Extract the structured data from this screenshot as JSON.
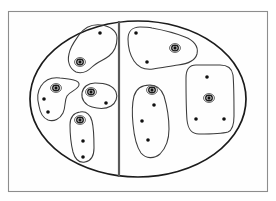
{
  "figure": {
    "title": "",
    "caption": ""
  },
  "colors": {
    "background": "#ffffff",
    "frame_stroke": "#8d8d8d",
    "universe_stroke": "#1b1b1b",
    "divider_stroke": "#5a5a5a",
    "region_stroke": "#3b3b3b",
    "point_fill": "#101010",
    "ring_stroke": "#1b1b1b"
  },
  "frame": {
    "name": "outer-frame",
    "x": 8,
    "y": 11,
    "width": 260,
    "height": 181
  },
  "universe": {
    "name": "universe-ellipse",
    "cx": 138,
    "cy": 99,
    "rx": 108,
    "ry": 78
  },
  "divider": {
    "name": "vertical-divider",
    "x1": 119,
    "y1": 21,
    "x2": 119,
    "y2": 177
  },
  "regions": [
    {
      "id": "region-left-top",
      "side": "left",
      "path": "M 101 25 C 92 24 84 28 79 35 C 74 42 70 47 69 54 C 67 62 70 69 76 72 C 82 74 88 71 92 67 C 97 62 104 60 109 56 C 114 52 117 45 117 38 C 117 31 110 26 101 25 Z"
    },
    {
      "id": "region-left-middle",
      "side": "left",
      "path": "M 60 78 C 52 77 45 80 41 86 C 37 92 37 99 39 106 C 40 112 43 118 48 120 C 54 122 60 119 63 113 C 66 107 64 101 67 96 C 70 91 78 90 79 85 C 80 80 70 79 60 78 Z"
    },
    {
      "id": "region-left-center",
      "side": "left",
      "path": "M 95 83 C 88 83 83 87 82 93 C 81 99 85 105 92 107 C 99 109 106 109 111 106 C 116 103 118 97 116 92 C 114 87 107 83 95 83 Z"
    },
    {
      "id": "region-left-bottom",
      "side": "left",
      "path": "M 80 112 C 73 113 70 118 70 125 C 70 134 71 144 73 152 C 75 159 79 163 85 162 C 91 161 94 156 94 148 C 94 139 94 129 92 121 C 90 114 86 111 80 112 Z"
    },
    {
      "id": "region-right-top",
      "side": "right",
      "path": "M 140 27 C 132 27 128 32 128 39 C 128 47 130 55 134 61 C 138 67 145 70 153 69 C 162 68 170 66 178 65 C 187 64 195 61 197 54 C 199 46 193 40 185 37 C 175 33 163 30 152 28 C 148 27 144 27 140 27 Z"
    },
    {
      "id": "region-right-center",
      "side": "right",
      "path": "M 150 85 C 142 85 136 89 134 96 C 132 104 132 114 133 124 C 134 135 136 146 141 153 C 146 159 154 159 160 154 C 166 148 169 139 169 129 C 169 118 167 106 164 96 C 161 88 157 85 150 85 Z"
    },
    {
      "id": "region-right-far",
      "side": "right",
      "path": "M 196 65 C 189 65 186 70 186 78 C 186 92 186 108 187 120 C 188 129 191 134 199 134 C 210 134 221 134 228 132 C 233 130 234 124 234 116 C 234 101 234 85 233 75 C 232 68 228 65 220 65 C 212 65 204 65 196 65 Z"
    }
  ],
  "points": [
    {
      "id": "pt-l1",
      "region": "region-left-top",
      "x": 100,
      "y": 33,
      "ringed": false
    },
    {
      "id": "pt-l2",
      "region": "region-left-top",
      "x": 80,
      "y": 62,
      "ringed": true
    },
    {
      "id": "pt-l3",
      "region": "region-left-middle",
      "x": 56,
      "y": 88,
      "ringed": true
    },
    {
      "id": "pt-l4",
      "region": "region-left-middle",
      "x": 44,
      "y": 99,
      "ringed": false
    },
    {
      "id": "pt-l5",
      "region": "region-left-middle",
      "x": 48,
      "y": 112,
      "ringed": false
    },
    {
      "id": "pt-l6",
      "region": "region-left-center",
      "x": 91,
      "y": 92,
      "ringed": true
    },
    {
      "id": "pt-l7",
      "region": "region-left-center",
      "x": 106,
      "y": 103,
      "ringed": false
    },
    {
      "id": "pt-l8",
      "region": "region-left-bottom",
      "x": 80,
      "y": 120,
      "ringed": true
    },
    {
      "id": "pt-l9",
      "region": "region-left-bottom",
      "x": 83,
      "y": 141,
      "ringed": false
    },
    {
      "id": "pt-l10",
      "region": "region-left-bottom",
      "x": 83,
      "y": 157,
      "ringed": false
    },
    {
      "id": "pt-r1",
      "region": "region-right-top",
      "x": 136,
      "y": 33,
      "ringed": false
    },
    {
      "id": "pt-r2",
      "region": "region-right-top",
      "x": 175,
      "y": 48,
      "ringed": true
    },
    {
      "id": "pt-r3",
      "region": "region-right-top",
      "x": 147,
      "y": 62,
      "ringed": false
    },
    {
      "id": "pt-r4",
      "region": "region-right-center",
      "x": 152,
      "y": 90,
      "ringed": true
    },
    {
      "id": "pt-r5",
      "region": "region-right-center",
      "x": 154,
      "y": 105,
      "ringed": false
    },
    {
      "id": "pt-r6",
      "region": "region-right-center",
      "x": 142,
      "y": 121,
      "ringed": false
    },
    {
      "id": "pt-r7",
      "region": "region-right-center",
      "x": 148,
      "y": 140,
      "ringed": false
    },
    {
      "id": "pt-r8",
      "region": "region-right-far",
      "x": 207,
      "y": 77,
      "ringed": false
    },
    {
      "id": "pt-r9",
      "region": "region-right-far",
      "x": 209,
      "y": 98,
      "ringed": true
    },
    {
      "id": "pt-r10",
      "region": "region-right-far",
      "x": 196,
      "y": 119,
      "ringed": false
    },
    {
      "id": "pt-r11",
      "region": "region-right-far",
      "x": 224,
      "y": 119,
      "ringed": false
    }
  ],
  "counts": {
    "regions_total": 7,
    "regions_left": 4,
    "regions_right": 3,
    "points_total": 21,
    "points_ringed": 7
  }
}
